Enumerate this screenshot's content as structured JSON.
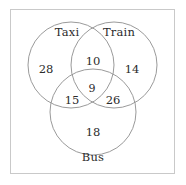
{
  "diagram": {
    "kind": "venn-diagram",
    "set_count": 3,
    "border_color": "#c9c9c9",
    "circle_stroke_color": "#8f8f8f",
    "text_color": "#2b2b2b",
    "background_color": "#ffffff",
    "sets": [
      {
        "id": "taxi",
        "label": "Taxi",
        "label_x": 67,
        "label_y": 33,
        "cx": 71,
        "cy": 65,
        "r": 43
      },
      {
        "id": "train",
        "label": "Train",
        "label_x": 119,
        "label_y": 33,
        "cx": 114,
        "cy": 65,
        "r": 43
      },
      {
        "id": "bus",
        "label": "Bus",
        "label_x": 93,
        "label_y": 158,
        "cx": 93,
        "cy": 112,
        "r": 43
      }
    ],
    "regions": [
      {
        "id": "taxi-only",
        "sets": [
          "taxi"
        ],
        "value": "28",
        "x": 46,
        "y": 70
      },
      {
        "id": "train-only",
        "sets": [
          "train"
        ],
        "value": "14",
        "x": 132,
        "y": 70
      },
      {
        "id": "bus-only",
        "sets": [
          "bus"
        ],
        "value": "18",
        "x": 93,
        "y": 133
      },
      {
        "id": "taxi-train",
        "sets": [
          "taxi",
          "train"
        ],
        "value": "10",
        "x": 93,
        "y": 62
      },
      {
        "id": "taxi-bus",
        "sets": [
          "taxi",
          "bus"
        ],
        "value": "15",
        "x": 72,
        "y": 101
      },
      {
        "id": "train-bus",
        "sets": [
          "train",
          "bus"
        ],
        "value": "26",
        "x": 113,
        "y": 101
      },
      {
        "id": "taxi-train-bus",
        "sets": [
          "taxi",
          "train",
          "bus"
        ],
        "value": "9",
        "x": 92,
        "y": 88
      }
    ]
  },
  "chart_data": {
    "type": "venn",
    "title": "",
    "set_labels": [
      "Taxi",
      "Train",
      "Bus"
    ],
    "region_values": {
      "Taxi only": 28,
      "Train only": 14,
      "Bus only": 18,
      "Taxi & Train only": 10,
      "Taxi & Bus only": 15,
      "Train & Bus only": 26,
      "Taxi & Train & Bus": 9
    },
    "totals": {
      "Taxi": 62,
      "Train": 59,
      "Bus": 68,
      "all_elements": 120
    },
    "legend": "none",
    "grid": false
  }
}
